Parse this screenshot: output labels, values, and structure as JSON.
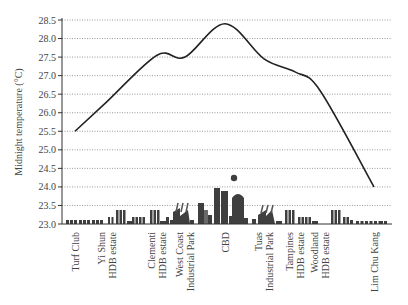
{
  "chart_data": {
    "type": "line",
    "title": "",
    "xlabel": "",
    "ylabel": "Midnight temperature (°C)",
    "ylim": [
      23.0,
      28.5
    ],
    "yticks": [
      "23.0",
      "23.5",
      "24.0",
      "24.5",
      "25.0",
      "25.5",
      "26.0",
      "26.5",
      "27.0",
      "27.5",
      "28.0",
      "28.5"
    ],
    "grid": "horizontal dotted",
    "legend": null,
    "categories": [
      [
        "Turf Club"
      ],
      [
        "Yi Shun",
        "HDB estate"
      ],
      [
        "Clementi",
        "HDB estate"
      ],
      [
        "West Coast",
        "Industrial Park"
      ],
      [
        "CBD"
      ],
      [
        "Tuas",
        "Industrial Park"
      ],
      [
        "Tampines",
        "HDB estate"
      ],
      [
        "Woodland",
        "HDB estate"
      ],
      [
        "Lim Chu Kang"
      ]
    ],
    "series": [
      {
        "name": "Midnight temperature",
        "x_positions": [
          75,
          107,
          157,
          185,
          225,
          264,
          295,
          320,
          374
        ],
        "values": [
          25.5,
          26.3,
          27.55,
          27.5,
          28.4,
          27.45,
          27.1,
          26.6,
          24.0
        ]
      }
    ],
    "annotations": [
      "Decorative city skyline silhouette along x-axis (houses, HDB blocks, factories, CBD towers, balloon)"
    ]
  }
}
